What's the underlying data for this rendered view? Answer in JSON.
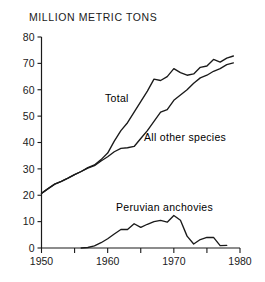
{
  "chart_data": {
    "type": "line",
    "title": "MILLION METRIC TONS",
    "xlabel": "",
    "ylabel": "",
    "xlim": [
      1950,
      1980
    ],
    "ylim": [
      0,
      80
    ],
    "ytick_labels": [
      "0",
      "10",
      "20",
      "30",
      "40",
      "50",
      "60",
      "70",
      "80"
    ],
    "yticks": [
      0,
      10,
      20,
      30,
      40,
      50,
      60,
      70,
      80
    ],
    "xtick_labels": [
      "1950",
      "1960",
      "1970",
      "1980"
    ],
    "xticks": [
      1950,
      1960,
      1970,
      1980
    ],
    "xminor_ticks": [
      1955,
      1965,
      1975
    ],
    "grid": false,
    "legend_position": "inline-annotations",
    "series": [
      {
        "name": "Total",
        "label_text": "Total",
        "x": [
          1950,
          1951,
          1952,
          1953,
          1954,
          1955,
          1956,
          1957,
          1958,
          1959,
          1960,
          1961,
          1962,
          1963,
          1964,
          1965,
          1966,
          1967,
          1968,
          1969,
          1970,
          1971,
          1972,
          1973,
          1974,
          1975,
          1976,
          1977,
          1978,
          1979
        ],
        "values": [
          20.7,
          22.5,
          24.2,
          25.3,
          26.5,
          27.8,
          29.0,
          30.5,
          31.5,
          33.5,
          36.0,
          40.5,
          44.5,
          47.5,
          51.5,
          55.5,
          59.5,
          64.0,
          63.5,
          65.0,
          68.0,
          66.5,
          65.5,
          66.0,
          68.5,
          69.0,
          71.5,
          70.5,
          72.0,
          72.8
        ]
      },
      {
        "name": "All other species",
        "label_text": "All other species",
        "x": [
          1950,
          1951,
          1952,
          1953,
          1954,
          1955,
          1956,
          1957,
          1958,
          1959,
          1960,
          1961,
          1962,
          1963,
          1964,
          1965,
          1966,
          1967,
          1968,
          1969,
          1970,
          1971,
          1972,
          1973,
          1974,
          1975,
          1976,
          1977,
          1978,
          1979
        ],
        "values": [
          20.7,
          22.5,
          24.2,
          25.3,
          26.5,
          27.8,
          29.0,
          30.3,
          31.2,
          33.0,
          34.6,
          36.5,
          37.8,
          38.0,
          38.5,
          41.5,
          44.5,
          48.0,
          51.5,
          52.5,
          56.0,
          58.0,
          60.0,
          62.5,
          64.5,
          65.5,
          67.0,
          68.0,
          69.5,
          70.2
        ]
      },
      {
        "name": "Peruvian anchovies",
        "label_text": "Peruvian anchovies",
        "x": [
          1956,
          1957,
          1958,
          1959,
          1960,
          1961,
          1962,
          1963,
          1964,
          1965,
          1966,
          1967,
          1968,
          1969,
          1970,
          1971,
          1972,
          1973,
          1974,
          1975,
          1976,
          1977,
          1978
        ],
        "values": [
          0.0,
          0.2,
          0.8,
          2.0,
          3.5,
          5.3,
          7.0,
          7.0,
          9.2,
          7.8,
          9.0,
          10.0,
          10.5,
          9.8,
          12.3,
          10.5,
          4.5,
          1.5,
          3.2,
          4.0,
          4.0,
          0.9,
          1.0
        ]
      }
    ]
  }
}
